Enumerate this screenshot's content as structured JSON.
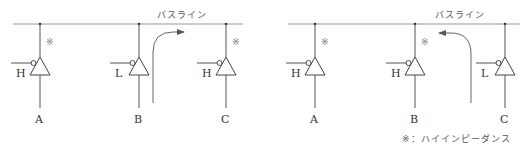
{
  "bus_label": "バスライン",
  "high_z_mark": "※",
  "footnote": "※：ハイインピーダンス",
  "colors": {
    "line": "#555555",
    "arrow": "#666666",
    "bus": "#999999"
  },
  "panels": [
    {
      "name": "left",
      "arrow_direction": "right",
      "buffers": [
        {
          "label": "A",
          "control": "H",
          "high_impedance": true
        },
        {
          "label": "B",
          "control": "L",
          "high_impedance": false
        },
        {
          "label": "C",
          "control": "H",
          "high_impedance": true
        }
      ]
    },
    {
      "name": "right",
      "arrow_direction": "left",
      "buffers": [
        {
          "label": "A",
          "control": "H",
          "high_impedance": true
        },
        {
          "label": "B",
          "control": "H",
          "high_impedance": true
        },
        {
          "label": "C",
          "control": "L",
          "high_impedance": false
        }
      ]
    }
  ]
}
